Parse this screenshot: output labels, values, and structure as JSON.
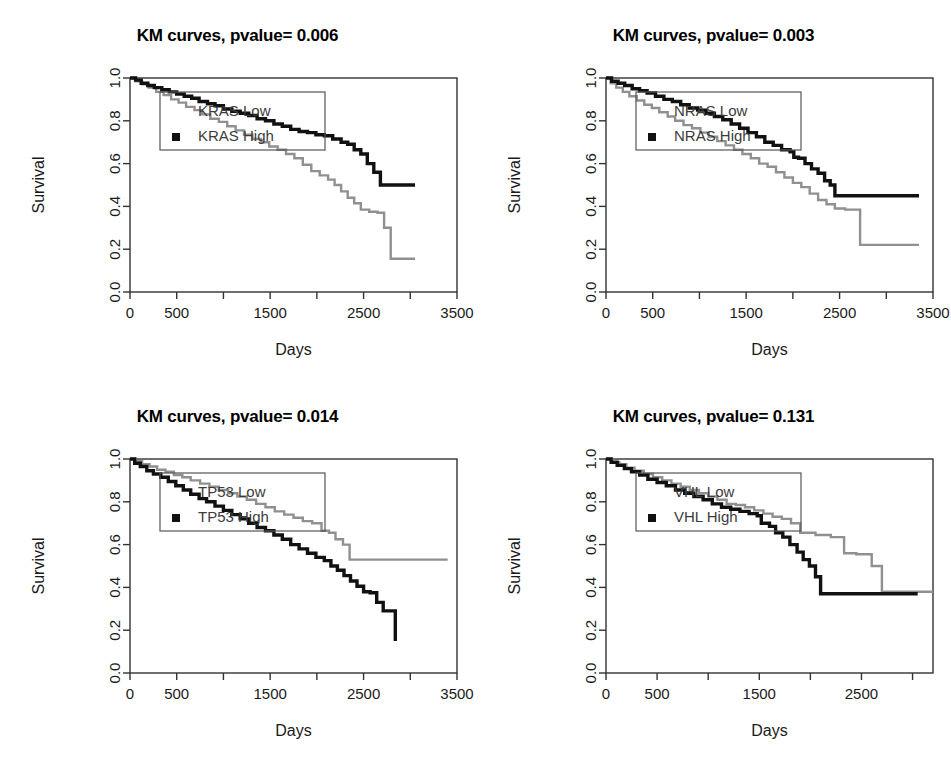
{
  "figure": {
    "layout": "2x2 grid of Kaplan-Meier survival panels",
    "background": "#ffffff"
  },
  "colors": {
    "high": "#111111",
    "low": "#909090",
    "axis": "#333333",
    "text": "#1a1a1a",
    "legend_text": "#3c3c3c"
  },
  "chart_data": [
    {
      "id": "kras",
      "type": "line",
      "title": "KM curves, pvalue= 0.006",
      "xlabel": "Days",
      "ylabel": "Survival",
      "pvalue": 0.006,
      "gene": "KRAS",
      "xlim": [
        0,
        3500
      ],
      "ylim": [
        0,
        1
      ],
      "xticks": [
        0,
        500,
        1000,
        1500,
        2000,
        2500,
        3000,
        3500
      ],
      "xticklabels": [
        "0",
        "500",
        "",
        "1500",
        "",
        "2500",
        "",
        "3500"
      ],
      "yticks": [
        0.0,
        0.2,
        0.4,
        0.6,
        0.8,
        1.0
      ],
      "yticklabels": [
        "0.0",
        "0.2",
        "0.4",
        "0.6",
        "0.8",
        "1.0"
      ],
      "grid": false,
      "legend_position": "top-left",
      "legend": [
        {
          "label": "KRAS Low",
          "series": "low",
          "marker": "none"
        },
        {
          "label": "KRAS High",
          "series": "high",
          "marker": "square"
        }
      ],
      "series": [
        {
          "name": "KRAS High",
          "key": "high",
          "color": "#111111",
          "step": "post",
          "x": [
            0,
            60,
            120,
            190,
            260,
            340,
            420,
            500,
            580,
            660,
            740,
            830,
            910,
            1000,
            1090,
            1180,
            1270,
            1360,
            1450,
            1540,
            1630,
            1720,
            1810,
            1900,
            1990,
            2080,
            2170,
            2260,
            2330,
            2400,
            2470,
            2540,
            2610,
            2680,
            3050
          ],
          "y": [
            1.0,
            0.99,
            0.975,
            0.965,
            0.955,
            0.945,
            0.935,
            0.925,
            0.915,
            0.905,
            0.89,
            0.88,
            0.87,
            0.855,
            0.845,
            0.835,
            0.825,
            0.81,
            0.8,
            0.785,
            0.775,
            0.76,
            0.75,
            0.745,
            0.735,
            0.73,
            0.715,
            0.7,
            0.69,
            0.665,
            0.645,
            0.6,
            0.56,
            0.5,
            0.5
          ]
        },
        {
          "name": "KRAS Low",
          "key": "low",
          "color": "#909090",
          "step": "post",
          "x": [
            0,
            60,
            130,
            200,
            280,
            360,
            440,
            520,
            600,
            690,
            770,
            860,
            950,
            1040,
            1130,
            1220,
            1310,
            1400,
            1490,
            1580,
            1670,
            1760,
            1850,
            1940,
            2030,
            2120,
            2190,
            2260,
            2330,
            2400,
            2470,
            2560,
            2650,
            2720,
            2790,
            3050
          ],
          "y": [
            1.0,
            0.985,
            0.97,
            0.955,
            0.935,
            0.92,
            0.9,
            0.885,
            0.865,
            0.85,
            0.83,
            0.81,
            0.795,
            0.775,
            0.755,
            0.735,
            0.715,
            0.7,
            0.68,
            0.665,
            0.645,
            0.625,
            0.595,
            0.565,
            0.545,
            0.525,
            0.5,
            0.47,
            0.44,
            0.415,
            0.385,
            0.375,
            0.37,
            0.3,
            0.155,
            0.155
          ]
        }
      ]
    },
    {
      "id": "nras",
      "type": "line",
      "title": "KM curves, pvalue= 0.003",
      "xlabel": "Days",
      "ylabel": "Survival",
      "pvalue": 0.003,
      "gene": "NRAS",
      "xlim": [
        0,
        3500
      ],
      "ylim": [
        0,
        1
      ],
      "xticks": [
        0,
        500,
        1000,
        1500,
        2000,
        2500,
        3000,
        3500
      ],
      "xticklabels": [
        "0",
        "500",
        "",
        "1500",
        "",
        "2500",
        "",
        "3500"
      ],
      "yticks": [
        0.0,
        0.2,
        0.4,
        0.6,
        0.8,
        1.0
      ],
      "yticklabels": [
        "0.0",
        "0.2",
        "0.4",
        "0.6",
        "0.8",
        "1.0"
      ],
      "grid": false,
      "legend_position": "top-left",
      "legend": [
        {
          "label": "NRAS Low",
          "series": "low",
          "marker": "none"
        },
        {
          "label": "NRAS High",
          "series": "high",
          "marker": "square"
        }
      ],
      "series": [
        {
          "name": "NRAS High",
          "key": "high",
          "color": "#111111",
          "step": "post",
          "x": [
            0,
            60,
            130,
            200,
            280,
            360,
            440,
            530,
            620,
            710,
            800,
            890,
            980,
            1070,
            1160,
            1250,
            1340,
            1430,
            1520,
            1610,
            1700,
            1790,
            1880,
            1970,
            2010,
            2060,
            2130,
            2200,
            2270,
            2340,
            2400,
            2450,
            3350
          ],
          "y": [
            1.0,
            0.985,
            0.975,
            0.965,
            0.95,
            0.94,
            0.93,
            0.915,
            0.9,
            0.89,
            0.875,
            0.86,
            0.85,
            0.835,
            0.82,
            0.805,
            0.785,
            0.765,
            0.745,
            0.725,
            0.7,
            0.685,
            0.665,
            0.655,
            0.63,
            0.625,
            0.6,
            0.575,
            0.555,
            0.52,
            0.5,
            0.45,
            0.45
          ]
        },
        {
          "name": "NRAS Low",
          "key": "low",
          "color": "#909090",
          "step": "post",
          "x": [
            0,
            50,
            110,
            180,
            250,
            330,
            410,
            490,
            570,
            660,
            740,
            830,
            920,
            1010,
            1100,
            1190,
            1280,
            1370,
            1460,
            1550,
            1640,
            1730,
            1820,
            1910,
            2000,
            2090,
            2180,
            2270,
            2360,
            2450,
            2560,
            2680,
            2720,
            3350
          ],
          "y": [
            1.0,
            0.975,
            0.955,
            0.935,
            0.915,
            0.895,
            0.875,
            0.86,
            0.84,
            0.82,
            0.8,
            0.78,
            0.765,
            0.745,
            0.725,
            0.705,
            0.685,
            0.665,
            0.645,
            0.625,
            0.6,
            0.585,
            0.56,
            0.535,
            0.51,
            0.49,
            0.46,
            0.43,
            0.41,
            0.39,
            0.385,
            0.385,
            0.22,
            0.22
          ]
        }
      ]
    },
    {
      "id": "tp53",
      "type": "line",
      "title": "KM curves, pvalue= 0.014",
      "xlabel": "Days",
      "ylabel": "Survival",
      "pvalue": 0.014,
      "gene": "TP53",
      "xlim": [
        0,
        3500
      ],
      "ylim": [
        0,
        1
      ],
      "xticks": [
        0,
        500,
        1000,
        1500,
        2000,
        2500,
        3000,
        3500
      ],
      "xticklabels": [
        "0",
        "500",
        "",
        "1500",
        "",
        "2500",
        "",
        "3500"
      ],
      "yticks": [
        0.0,
        0.2,
        0.4,
        0.6,
        0.8,
        1.0
      ],
      "yticklabels": [
        "0.0",
        "0.2",
        "0.4",
        "0.6",
        "0.8",
        "1.0"
      ],
      "grid": false,
      "legend_position": "top-left",
      "legend": [
        {
          "label": "TP53 Low",
          "series": "low",
          "marker": "none"
        },
        {
          "label": "TP53 High",
          "series": "high",
          "marker": "square"
        }
      ],
      "series": [
        {
          "name": "TP53 High",
          "key": "high",
          "color": "#111111",
          "step": "post",
          "x": [
            0,
            50,
            110,
            180,
            250,
            330,
            410,
            490,
            570,
            650,
            740,
            820,
            910,
            1000,
            1090,
            1180,
            1270,
            1360,
            1450,
            1540,
            1630,
            1720,
            1810,
            1900,
            1990,
            2080,
            2150,
            2220,
            2290,
            2360,
            2430,
            2500,
            2570,
            2640,
            2710,
            2780,
            2840
          ],
          "y": [
            1.0,
            0.98,
            0.965,
            0.945,
            0.93,
            0.915,
            0.895,
            0.875,
            0.855,
            0.835,
            0.815,
            0.8,
            0.78,
            0.76,
            0.74,
            0.72,
            0.7,
            0.68,
            0.665,
            0.645,
            0.625,
            0.6,
            0.58,
            0.56,
            0.54,
            0.525,
            0.5,
            0.48,
            0.455,
            0.43,
            0.405,
            0.38,
            0.375,
            0.33,
            0.29,
            0.29,
            0.15
          ]
        },
        {
          "name": "TP53 Low",
          "key": "low",
          "color": "#909090",
          "step": "post",
          "x": [
            0,
            60,
            130,
            210,
            290,
            380,
            470,
            560,
            650,
            750,
            850,
            950,
            1050,
            1150,
            1250,
            1350,
            1450,
            1550,
            1650,
            1750,
            1850,
            1950,
            2050,
            2130,
            2200,
            2280,
            2350,
            3400
          ],
          "y": [
            1.0,
            0.99,
            0.975,
            0.965,
            0.95,
            0.94,
            0.925,
            0.915,
            0.9,
            0.885,
            0.87,
            0.855,
            0.84,
            0.825,
            0.81,
            0.79,
            0.775,
            0.755,
            0.74,
            0.725,
            0.71,
            0.7,
            0.665,
            0.655,
            0.625,
            0.6,
            0.53,
            0.53
          ]
        }
      ]
    },
    {
      "id": "vhl",
      "type": "line",
      "title": "KM curves, pvalue= 0.131",
      "xlabel": "Days",
      "ylabel": "Survival",
      "pvalue": 0.131,
      "gene": "VHL",
      "xlim": [
        0,
        3200
      ],
      "ylim": [
        0,
        1
      ],
      "xticks": [
        0,
        500,
        1000,
        1500,
        2000,
        2500,
        3000
      ],
      "xticklabels": [
        "0",
        "500",
        "",
        "1500",
        "",
        "2500",
        ""
      ],
      "yticks": [
        0.0,
        0.2,
        0.4,
        0.6,
        0.8,
        1.0
      ],
      "yticklabels": [
        "0.0",
        "0.2",
        "0.4",
        "0.6",
        "0.8",
        "1.0"
      ],
      "grid": false,
      "legend_position": "top-left",
      "legend": [
        {
          "label": "VHL Low",
          "series": "low",
          "marker": "none"
        },
        {
          "label": "VHL High",
          "series": "high",
          "marker": "square"
        }
      ],
      "series": [
        {
          "name": "VHL High",
          "key": "high",
          "color": "#111111",
          "step": "post",
          "x": [
            0,
            50,
            110,
            180,
            250,
            330,
            410,
            500,
            590,
            680,
            770,
            860,
            950,
            1040,
            1130,
            1220,
            1310,
            1400,
            1480,
            1520,
            1600,
            1660,
            1730,
            1800,
            1870,
            1930,
            1990,
            2050,
            2100,
            3050
          ],
          "y": [
            1.0,
            0.985,
            0.97,
            0.955,
            0.94,
            0.925,
            0.905,
            0.89,
            0.875,
            0.855,
            0.84,
            0.825,
            0.81,
            0.79,
            0.775,
            0.765,
            0.755,
            0.745,
            0.735,
            0.7,
            0.685,
            0.655,
            0.635,
            0.6,
            0.565,
            0.53,
            0.5,
            0.45,
            0.37,
            0.37
          ]
        },
        {
          "name": "VHL Low",
          "key": "low",
          "color": "#909090",
          "step": "post",
          "x": [
            0,
            60,
            130,
            200,
            280,
            370,
            460,
            550,
            640,
            730,
            820,
            910,
            1000,
            1090,
            1180,
            1270,
            1360,
            1450,
            1540,
            1630,
            1720,
            1810,
            1900,
            2050,
            2200,
            2330,
            2450,
            2600,
            2700,
            3200
          ],
          "y": [
            1.0,
            0.985,
            0.975,
            0.96,
            0.945,
            0.93,
            0.915,
            0.9,
            0.885,
            0.87,
            0.855,
            0.84,
            0.825,
            0.81,
            0.79,
            0.785,
            0.775,
            0.76,
            0.745,
            0.73,
            0.72,
            0.7,
            0.655,
            0.645,
            0.635,
            0.56,
            0.555,
            0.5,
            0.38,
            0.38
          ]
        }
      ]
    }
  ]
}
